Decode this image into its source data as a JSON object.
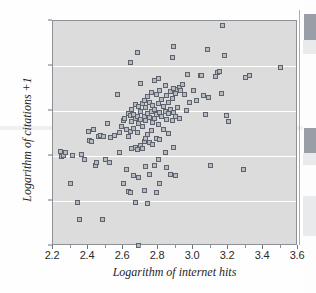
{
  "chart_data": {
    "type": "scatter",
    "title": "",
    "xlabel": "Logarithm of internet hits",
    "ylabel": "Logarithm of citations +1",
    "xlim": [
      2.2,
      3.6
    ],
    "ylim": [
      0,
      2.5
    ],
    "xticks": [
      "2.2",
      "2.4",
      "2.6",
      "2.8",
      "3.0",
      "3.2",
      "3.4",
      "3.6"
    ],
    "xtick_values": [
      2.2,
      2.4,
      2.6,
      2.8,
      3.0,
      3.2,
      3.4,
      3.6
    ],
    "xminor_values": [
      2.3,
      2.5,
      2.7,
      2.9,
      3.1,
      3.3,
      3.5
    ],
    "yticks": [
      "0",
      "0.5",
      "1.0",
      "1.5",
      "2.0",
      "2.5"
    ],
    "ytick_values": [
      0,
      0.5,
      1.0,
      1.5,
      2.0,
      2.5
    ],
    "grid": "horizontal",
    "gridline_values": [
      0.5,
      1.0,
      1.5,
      2.0
    ],
    "legend": "none",
    "marker": "square",
    "marker_fill": "#b6bac1",
    "marker_edge": "#5d626c",
    "plot_background": "#dcdcdc",
    "gridline_color": "#ffffff",
    "n_points": 152,
    "points": [
      [
        2.24,
        1.05
      ],
      [
        2.25,
        1.0
      ],
      [
        2.26,
        1.01
      ],
      [
        2.27,
        1.04
      ],
      [
        2.3,
        0.7
      ],
      [
        2.31,
        1.01
      ],
      [
        2.34,
        0.48
      ],
      [
        2.35,
        0.29
      ],
      [
        2.36,
        1.02
      ],
      [
        2.38,
        0.96
      ],
      [
        2.4,
        1.27
      ],
      [
        2.41,
        1.17
      ],
      [
        2.42,
        1.16
      ],
      [
        2.43,
        1.3
      ],
      [
        2.44,
        0.9
      ],
      [
        2.45,
        0.93
      ],
      [
        2.46,
        1.22
      ],
      [
        2.47,
        1.23
      ],
      [
        2.48,
        0.29
      ],
      [
        2.49,
        1.22
      ],
      [
        2.5,
        0.96
      ],
      [
        2.51,
        1.36
      ],
      [
        2.52,
        0.93
      ],
      [
        2.53,
        1.21
      ],
      [
        2.55,
        1.23
      ],
      [
        2.57,
        1.68
      ],
      [
        2.58,
        1.26
      ],
      [
        2.58,
        1.04
      ],
      [
        2.59,
        1.33
      ],
      [
        2.6,
        1.4
      ],
      [
        2.6,
        0.7
      ],
      [
        2.61,
        1.42
      ],
      [
        2.62,
        1.3
      ],
      [
        2.62,
        0.85
      ],
      [
        2.63,
        1.47
      ],
      [
        2.63,
        1.22
      ],
      [
        2.63,
        0.61
      ],
      [
        2.64,
        2.04
      ],
      [
        2.64,
        1.45
      ],
      [
        2.64,
        1.27
      ],
      [
        2.64,
        0.6
      ],
      [
        2.65,
        1.52
      ],
      [
        2.65,
        1.38
      ],
      [
        2.65,
        1.08
      ],
      [
        2.66,
        1.46
      ],
      [
        2.66,
        1.31
      ],
      [
        2.66,
        0.78
      ],
      [
        2.67,
        1.57
      ],
      [
        2.67,
        1.42
      ],
      [
        2.67,
        1.1
      ],
      [
        2.67,
        0.48
      ],
      [
        2.68,
        2.15
      ],
      [
        2.68,
        1.44
      ],
      [
        2.68,
        1.26
      ],
      [
        2.68,
        1.07
      ],
      [
        2.69,
        0.01
      ],
      [
        2.69,
        1.55
      ],
      [
        2.69,
        1.36
      ],
      [
        2.69,
        0.76
      ],
      [
        2.7,
        1.81
      ],
      [
        2.7,
        1.5
      ],
      [
        2.7,
        1.41
      ],
      [
        2.7,
        1.12
      ],
      [
        2.71,
        1.58
      ],
      [
        2.71,
        1.33
      ],
      [
        2.71,
        1.08
      ],
      [
        2.72,
        1.62
      ],
      [
        2.72,
        1.44
      ],
      [
        2.72,
        1.16
      ],
      [
        2.72,
        0.62
      ],
      [
        2.73,
        1.54
      ],
      [
        2.73,
        1.39
      ],
      [
        2.73,
        1.19
      ],
      [
        2.73,
        0.88
      ],
      [
        2.74,
        1.66
      ],
      [
        2.74,
        1.47
      ],
      [
        2.74,
        1.24
      ],
      [
        2.74,
        0.47
      ],
      [
        2.75,
        1.6
      ],
      [
        2.75,
        1.43
      ],
      [
        2.75,
        1.15
      ],
      [
        2.75,
        0.79
      ],
      [
        2.76,
        1.71
      ],
      [
        2.76,
        1.49
      ],
      [
        2.76,
        1.28
      ],
      [
        2.77,
        1.56
      ],
      [
        2.77,
        1.37
      ],
      [
        2.77,
        1.13
      ],
      [
        2.78,
        1.84
      ],
      [
        2.78,
        1.52
      ],
      [
        2.78,
        1.42
      ],
      [
        2.78,
        0.89
      ],
      [
        2.79,
        1.68
      ],
      [
        2.79,
        1.46
      ],
      [
        2.79,
        1.2
      ],
      [
        2.79,
        0.6
      ],
      [
        2.8,
        1.86
      ],
      [
        2.8,
        1.58
      ],
      [
        2.8,
        1.35
      ],
      [
        2.8,
        0.96
      ],
      [
        2.81,
        1.73
      ],
      [
        2.81,
        1.48
      ],
      [
        2.81,
        1.18
      ],
      [
        2.81,
        0.7
      ],
      [
        2.82,
        1.63
      ],
      [
        2.82,
        1.44
      ],
      [
        2.83,
        1.55
      ],
      [
        2.83,
        1.3
      ],
      [
        2.84,
        1.78
      ],
      [
        2.84,
        1.5
      ],
      [
        2.84,
        1.04
      ],
      [
        2.85,
        1.67
      ],
      [
        2.85,
        1.41
      ],
      [
        2.85,
        0.87
      ],
      [
        2.86,
        1.59
      ],
      [
        2.86,
        1.47
      ],
      [
        2.86,
        1.25
      ],
      [
        2.87,
        1.72
      ],
      [
        2.87,
        1.52
      ],
      [
        2.87,
        0.8
      ],
      [
        2.88,
        2.1
      ],
      [
        2.88,
        1.64
      ],
      [
        2.88,
        1.4
      ],
      [
        2.89,
        2.22
      ],
      [
        2.89,
        1.75
      ],
      [
        2.89,
        1.48
      ],
      [
        2.89,
        1.1
      ],
      [
        2.9,
        1.7
      ],
      [
        2.9,
        1.44
      ],
      [
        2.9,
        0.78
      ],
      [
        2.91,
        1.74
      ],
      [
        2.91,
        1.54
      ],
      [
        2.92,
        1.76
      ],
      [
        2.92,
        1.42
      ],
      [
        2.93,
        1.73
      ],
      [
        2.94,
        1.8
      ],
      [
        2.95,
        1.68
      ],
      [
        2.96,
        1.51
      ],
      [
        2.97,
        1.91
      ],
      [
        2.98,
        1.6
      ],
      [
        3.0,
        1.73
      ],
      [
        3.02,
        1.62
      ],
      [
        3.04,
        1.9
      ],
      [
        3.05,
        1.89
      ],
      [
        3.06,
        1.67
      ],
      [
        3.07,
        1.46
      ],
      [
        3.08,
        2.18
      ],
      [
        3.09,
        1.65
      ],
      [
        3.1,
        0.9
      ],
      [
        3.13,
        1.88
      ],
      [
        3.14,
        1.93
      ],
      [
        3.15,
        1.94
      ],
      [
        3.16,
        1.7
      ],
      [
        3.17,
        2.45
      ],
      [
        3.18,
        2.12
      ],
      [
        3.19,
        1.45
      ],
      [
        3.2,
        1.38
      ],
      [
        3.29,
        0.85
      ],
      [
        3.3,
        1.87
      ],
      [
        3.32,
        1.89
      ],
      [
        3.5,
        1.98
      ]
    ]
  }
}
